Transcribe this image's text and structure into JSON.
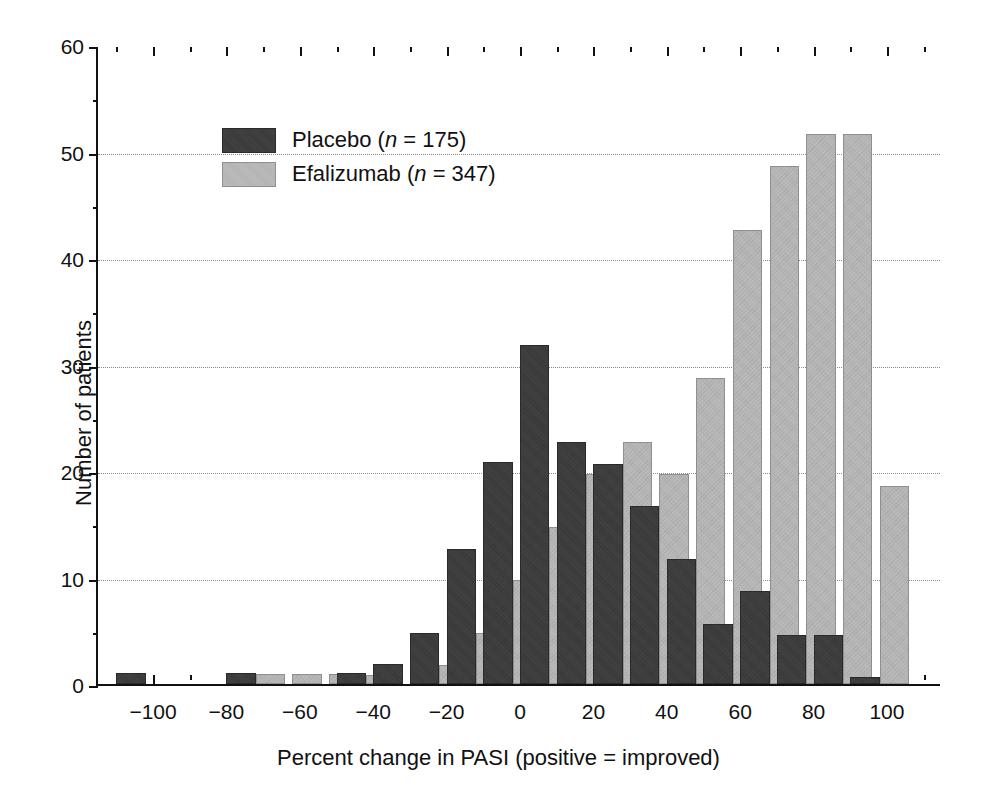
{
  "chart_data": {
    "type": "bar",
    "title": "",
    "subtitle": "",
    "xlabel": "Percent change in PASI (positive = improved)",
    "ylabel": "Number of patients",
    "xlim": [
      -115,
      115
    ],
    "ylim": [
      0,
      60
    ],
    "xticks": [
      -100,
      -80,
      -60,
      -40,
      -20,
      0,
      20,
      40,
      60,
      80,
      100
    ],
    "xtick_labels": [
      "−100",
      "−80",
      "−60",
      "−40",
      "−20",
      "0",
      "20",
      "40",
      "60",
      "80",
      "100"
    ],
    "yticks": [
      0,
      10,
      20,
      30,
      40,
      50,
      60
    ],
    "ytick_labels": [
      "0",
      "10",
      "20",
      "30",
      "40",
      "50",
      "60"
    ],
    "xtick_minor_step": 10,
    "grid": "horizontal-dotted",
    "bin_width": 10,
    "bar_width": 8,
    "legend_position": "top-left",
    "legend": [
      {
        "name": "Placebo",
        "n": 175,
        "label": "Placebo (n = 175)",
        "color": "#3a3a3a"
      },
      {
        "name": "Efalizumab",
        "n": 347,
        "label": "Efalizumab (n = 347)",
        "color": "#b3b3b3"
      }
    ],
    "bin_centers": [
      -105,
      -95,
      -85,
      -75,
      -65,
      -55,
      -45,
      -35,
      -25,
      -15,
      -5,
      5,
      15,
      25,
      35,
      45,
      55,
      65,
      75,
      85,
      95,
      105
    ],
    "series": [
      {
        "name": "Placebo",
        "color": "#3a3a3a",
        "values": [
          1.0,
          0,
          0,
          1.0,
          0,
          0,
          1.0,
          1.9,
          4.8,
          12.7,
          20.8,
          31.8,
          22.7,
          20.7,
          16.7,
          11.7,
          5.6,
          8.7,
          4.6,
          4.6,
          0.7,
          0
        ]
      },
      {
        "name": "Efalizumab",
        "color": "#b3b3b3",
        "values": [
          0,
          0,
          0,
          0.9,
          0.9,
          0.9,
          0.8,
          0,
          1.8,
          4.8,
          9.8,
          14.7,
          19.7,
          22.7,
          19.7,
          28.7,
          42.6,
          48.6,
          51.6,
          51.6,
          18.6,
          0
        ]
      }
    ]
  }
}
